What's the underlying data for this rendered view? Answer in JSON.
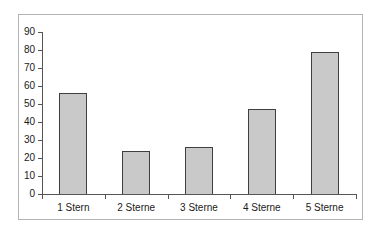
{
  "chart_data": {
    "type": "bar",
    "title": "",
    "xlabel": "",
    "ylabel": "",
    "categories": [
      "1 Stern",
      "2 Sterne",
      "3 Sterne",
      "4 Sterne",
      "5 Sterne"
    ],
    "values": [
      56,
      24,
      26,
      47,
      79
    ],
    "ylim": [
      0,
      90
    ],
    "yticks": [
      0,
      10,
      20,
      30,
      40,
      50,
      60,
      70,
      80,
      90
    ],
    "grid": false,
    "legend": null,
    "colors": {
      "bar_fill": "#c9c9c9",
      "bar_border": "#3f3f3f",
      "axis": "#555555",
      "tick": "#555555",
      "frame": "#b3b3b3",
      "text": "#1a1a1a",
      "background": "#ffffff"
    }
  }
}
